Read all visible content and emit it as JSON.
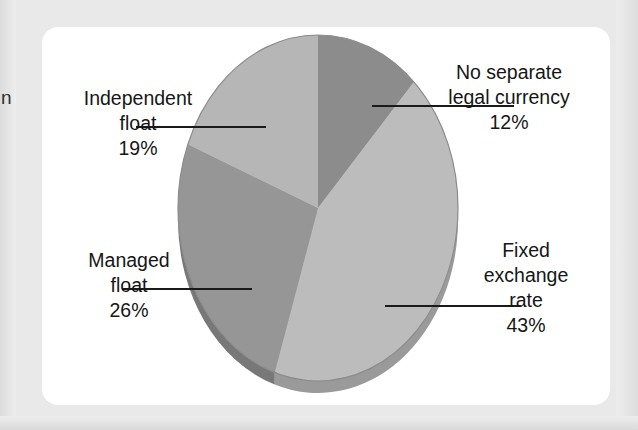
{
  "page": {
    "background_color": "#e9e9e9",
    "card_background": "#ffffff",
    "edge_fragment_text": "n"
  },
  "chart_data": {
    "type": "pie",
    "title": "",
    "subtitle": "",
    "xlabel": "",
    "ylabel": "",
    "legend_position": "callout-labels",
    "grid": false,
    "three_d": true,
    "start_angle_deg": 0,
    "direction": "clockwise",
    "categories": [
      "No separate legal currency",
      "Fixed exchange rate",
      "Managed float",
      "Independent float"
    ],
    "values": [
      12,
      43,
      26,
      19
    ],
    "unit": "%",
    "total": 100,
    "slices": [
      {
        "label": "No separate legal currency",
        "label_line1": "No separate",
        "label_line2": "legal currency",
        "value": 12,
        "value_text": "12%",
        "color": "#8c8c8c",
        "side_color": "#6f6f6f"
      },
      {
        "label": "Fixed exchange rate",
        "label_line1": "Fixed",
        "label_line2": "exchange",
        "label_line3": "rate",
        "value": 43,
        "value_text": "43%",
        "color": "#bcbcbc",
        "side_color": "#9a9a9a"
      },
      {
        "label": "Managed float",
        "label_line1": "Managed",
        "label_line2": "float",
        "value": 26,
        "value_text": "26%",
        "color": "#969696",
        "side_color": "#787878"
      },
      {
        "label": "Independent float",
        "label_line1": "Independent",
        "label_line2": "float",
        "value": 19,
        "value_text": "19%",
        "color": "#b6b6b6",
        "side_color": "#929292"
      }
    ]
  },
  "callouts": {
    "no_separate_legal_currency": {
      "text": "No separate\nlegal currency",
      "percent": "12%"
    },
    "fixed_exchange_rate": {
      "text": "Fixed\nexchange\nrate",
      "percent": "43%"
    },
    "managed_float": {
      "text": "Managed\nfloat",
      "percent": "26%"
    },
    "independent_float": {
      "text": "Independent\nfloat",
      "percent": "19%"
    }
  }
}
